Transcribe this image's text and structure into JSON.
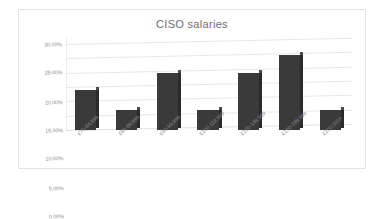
{
  "chart_data": {
    "type": "bar",
    "title": "CISO salaries",
    "xlabel": "",
    "ylabel": "",
    "categories": [
      "£70-84,999",
      "£85-89,999",
      "£90-99,999",
      "£100-119,999",
      "£120-149,999",
      "£150-199,999",
      "£200,000+"
    ],
    "values": [
      14,
      7,
      20,
      7,
      20,
      26,
      7
    ],
    "value_labels": [
      "14.00%",
      "7.00%",
      "20.00%",
      "7.00%",
      "20.00%",
      "26.00%",
      "7.00%"
    ],
    "ylim": [
      0,
      30
    ],
    "ytick_labels": [
      "0.00%",
      "5.00%",
      "10.00%",
      "15.00%",
      "20.00%",
      "25.00%",
      "30.00%"
    ],
    "ytick_values": [
      0,
      5,
      10,
      15,
      20,
      25,
      30
    ],
    "grid": true,
    "legend": false,
    "legend_position": "none",
    "series_name": "CISO salaries",
    "style": "3d-column",
    "colors": {
      "bar_face": "#3a3a3a",
      "bar_side": "#2b2b2b",
      "bar_top": "#4c4c4c",
      "gridline": "#e8e8e8",
      "axis_text": "#8a8a8a",
      "title_text": "#6d6d6d",
      "plot_background": "#ffffff",
      "frame_border": "#e3e3e3"
    }
  }
}
